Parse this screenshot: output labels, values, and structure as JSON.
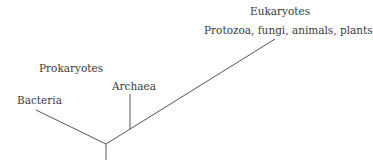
{
  "diagram": {
    "type": "phylogenetic-tree",
    "labels": {
      "eukaryotes": "Eukaryotes",
      "eukaryotes_members": "Protozoa, fungi, animals, plants",
      "prokaryotes": "Prokaryotes",
      "archaea": "Archaea",
      "bacteria": "Bacteria"
    },
    "line_color": "#555555"
  }
}
